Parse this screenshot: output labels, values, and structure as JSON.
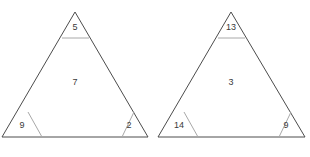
{
  "figure": {
    "type": "geometry-diagram",
    "background_color": "#ffffff",
    "outline_color": "#4c4c4c",
    "divider_color": "#a8a8a8",
    "label_color": "#3a3a3a",
    "shape_count": 2
  },
  "triangles": [
    {
      "name": "left-triangle",
      "apex": {
        "x": 75,
        "y": 12
      },
      "base_left": {
        "x": 2,
        "y": 137
      },
      "base_right": {
        "x": 148,
        "y": 137
      },
      "regions": [
        {
          "name": "apex-region",
          "label": "5",
          "label_x": 75,
          "label_y": 28
        },
        {
          "name": "interior-region",
          "label": "7",
          "label_x": 75,
          "label_y": 83
        },
        {
          "name": "bottom-left-region",
          "label": "9",
          "label_x": 22,
          "label_y": 126
        },
        {
          "name": "bottom-right-region",
          "label": "2",
          "label_x": 129,
          "label_y": 126
        }
      ],
      "dividers": [
        {
          "name": "apex-cut",
          "x1": 62,
          "y1": 38,
          "x2": 89,
          "y2": 38
        },
        {
          "name": "bottom-left-cut",
          "x1": 28,
          "y1": 112,
          "x2": 42,
          "y2": 137
        },
        {
          "name": "bottom-right-cut",
          "x1": 122,
          "y1": 137,
          "x2": 134,
          "y2": 112
        }
      ]
    },
    {
      "name": "right-triangle",
      "apex": {
        "x": 231,
        "y": 12
      },
      "base_left": {
        "x": 158,
        "y": 137
      },
      "base_right": {
        "x": 305,
        "y": 137
      },
      "regions": [
        {
          "name": "apex-region",
          "label": "13",
          "label_x": 231,
          "label_y": 28
        },
        {
          "name": "interior-region",
          "label": "3",
          "label_x": 231,
          "label_y": 83
        },
        {
          "name": "bottom-left-region",
          "label": "14",
          "label_x": 179,
          "label_y": 126
        },
        {
          "name": "bottom-right-region",
          "label": "9",
          "label_x": 286,
          "label_y": 126
        }
      ],
      "dividers": [
        {
          "name": "apex-cut",
          "x1": 218,
          "y1": 38,
          "x2": 245,
          "y2": 38
        },
        {
          "name": "bottom-left-cut",
          "x1": 184,
          "y1": 112,
          "x2": 198,
          "y2": 137
        },
        {
          "name": "bottom-right-cut",
          "x1": 279,
          "y1": 137,
          "x2": 291,
          "y2": 112
        }
      ]
    }
  ]
}
